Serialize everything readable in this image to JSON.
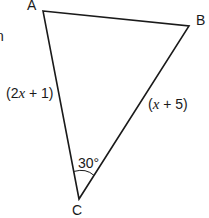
{
  "figure": {
    "type": "triangle",
    "stroke_color": "#1a1a1a",
    "background": "#ffffff",
    "vertices": [
      {
        "name": "A",
        "x": 43,
        "y": 11
      },
      {
        "name": "B",
        "x": 189,
        "y": 26
      },
      {
        "name": "C",
        "x": 79,
        "y": 199
      }
    ],
    "labels": {
      "vertex_a": "A",
      "vertex_b": "B",
      "vertex_c": "C"
    },
    "sides": {
      "ac": {
        "open": "(2",
        "var": "x",
        "rest": " + 1)"
      },
      "bc": {
        "open": "(",
        "var": "x",
        "rest": " + 5)"
      }
    },
    "angle": {
      "vertex": "C",
      "value": "30°"
    },
    "cut_off_text": "n"
  }
}
